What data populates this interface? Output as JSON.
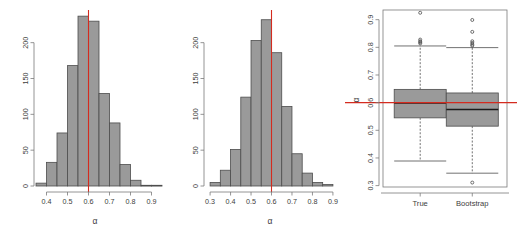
{
  "figure": {
    "title": "",
    "panels": [
      "histogram-true",
      "histogram-bootstrap",
      "boxplot-comparison"
    ],
    "reference_value": 0.6,
    "reference_color": "#d42b1f",
    "bar_fill": "#9a9a9a",
    "bar_stroke": "#4d4d4d"
  },
  "chart_data": [
    {
      "type": "bar",
      "id": "histogram-true",
      "title": "",
      "xlabel": "α",
      "ylabel": "",
      "xlim": [
        0.35,
        0.95
      ],
      "ylim": [
        0,
        240
      ],
      "xticks": [
        0.4,
        0.5,
        0.6,
        0.7,
        0.8,
        0.9
      ],
      "xtick_labels": [
        "0.4",
        "0.5",
        "0.6",
        "0.7",
        "0.8",
        "0.9"
      ],
      "yticks": [
        0,
        50,
        100,
        150,
        200
      ],
      "ytick_labels": [
        "0",
        "50",
        "100",
        "150",
        "200"
      ],
      "grid": false,
      "bin_width": 0.05,
      "bin_edges": [
        0.35,
        0.4,
        0.45,
        0.5,
        0.55,
        0.6,
        0.65,
        0.7,
        0.75,
        0.8,
        0.85,
        0.9,
        0.95
      ],
      "categories": [
        "0.35-0.40",
        "0.40-0.45",
        "0.45-0.50",
        "0.50-0.55",
        "0.55-0.60",
        "0.60-0.65",
        "0.65-0.70",
        "0.70-0.75",
        "0.75-0.80",
        "0.80-0.85",
        "0.85-0.90",
        "0.90-0.95"
      ],
      "values": [
        4,
        33,
        74,
        168,
        237,
        230,
        129,
        88,
        30,
        8,
        1,
        1
      ],
      "annotations": [
        {
          "type": "vline",
          "value": 0.6,
          "color": "#d42b1f"
        }
      ]
    },
    {
      "type": "bar",
      "id": "histogram-bootstrap",
      "title": "",
      "xlabel": "α",
      "ylabel": "",
      "xlim": [
        0.28,
        0.92
      ],
      "ylim": [
        0,
        240
      ],
      "xticks": [
        0.3,
        0.4,
        0.5,
        0.6,
        0.7,
        0.8,
        0.9
      ],
      "xtick_labels": [
        "0.3",
        "0.4",
        "0.5",
        "0.6",
        "0.7",
        "0.8",
        "0.9"
      ],
      "yticks": [
        0,
        50,
        100,
        150,
        200
      ],
      "ytick_labels": [
        "0",
        "50",
        "100",
        "150",
        "200"
      ],
      "grid": false,
      "bin_width": 0.05,
      "bin_edges": [
        0.3,
        0.35,
        0.4,
        0.45,
        0.5,
        0.55,
        0.6,
        0.65,
        0.7,
        0.75,
        0.8,
        0.85,
        0.9
      ],
      "categories": [
        "0.30-0.35",
        "0.35-0.40",
        "0.40-0.45",
        "0.45-0.50",
        "0.50-0.55",
        "0.55-0.60",
        "0.60-0.65",
        "0.65-0.70",
        "0.70-0.75",
        "0.75-0.80",
        "0.80-0.85",
        "0.85-0.90"
      ],
      "values": [
        5,
        22,
        51,
        124,
        203,
        232,
        186,
        111,
        45,
        18,
        5,
        2
      ],
      "annotations": [
        {
          "type": "vline",
          "value": 0.6,
          "color": "#d42b1f"
        }
      ]
    },
    {
      "type": "box",
      "id": "boxplot-comparison",
      "title": "",
      "xlabel": "",
      "ylabel": "α",
      "ylim": [
        0.295,
        0.935
      ],
      "yticks": [
        0.3,
        0.4,
        0.5,
        0.6,
        0.7,
        0.8,
        0.9
      ],
      "ytick_labels": [
        "0.3",
        "0.4",
        "0.5",
        "0.6",
        "0.7",
        "0.8",
        "0.9"
      ],
      "grid": false,
      "categories": [
        "True",
        "Bootstrap"
      ],
      "boxes": [
        {
          "name": "True",
          "min_whisker": 0.389,
          "q1": 0.545,
          "median": 0.599,
          "q3": 0.648,
          "max_whisker": 0.805,
          "outliers": [
            0.925,
            0.828,
            0.822,
            0.818,
            0.814
          ]
        },
        {
          "name": "Bootstrap",
          "min_whisker": 0.345,
          "q1": 0.515,
          "median": 0.575,
          "q3": 0.635,
          "max_whisker": 0.799,
          "outliers": [
            0.899,
            0.856,
            0.822,
            0.816,
            0.81,
            0.806,
            0.311
          ]
        }
      ],
      "annotations": [
        {
          "type": "hline",
          "value": 0.6,
          "color": "#d42b1f"
        }
      ]
    }
  ]
}
